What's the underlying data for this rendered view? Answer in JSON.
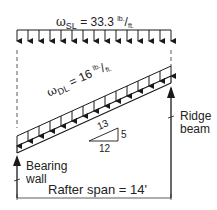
{
  "diagram": {
    "snow_load": {
      "symbol": "ω",
      "subscript": "SL",
      "equals": " = 33.3 ",
      "unit_num": "lb.",
      "unit_sep": "/",
      "unit_den": "ft."
    },
    "dead_load": {
      "symbol": "ω",
      "subscript": "DL",
      "equals": " = 16 ",
      "unit_num": "lb.",
      "unit_sep": "/",
      "unit_den": "ft."
    },
    "slope": {
      "hyp": "13",
      "rise": "5",
      "run": "12"
    },
    "support_left": {
      "line1": "Bearing",
      "line2": "wall"
    },
    "support_right": {
      "line1": "Ridge",
      "line2": "beam"
    },
    "span_label": "Rafter span = 14'",
    "colors": {
      "line": "#1a1a1a",
      "dash": "#333333"
    }
  }
}
